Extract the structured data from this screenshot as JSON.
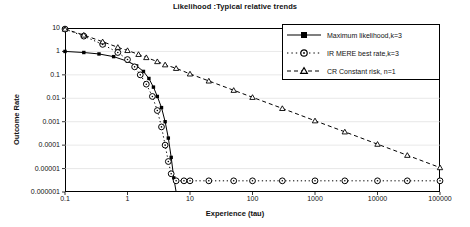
{
  "chart_data": {
    "type": "line",
    "title": "Likelihood :Typical relative trends",
    "xlabel": "Experience (tau)",
    "ylabel": "Outcome Rate",
    "xscale": "log",
    "yscale": "log",
    "xlim": [
      0.1,
      100000
    ],
    "ylim": [
      1e-06,
      10
    ],
    "xticks": [
      "0.1",
      "1",
      "10",
      "100",
      "1000",
      "10000",
      "100000"
    ],
    "yticks": [
      "10",
      "1",
      "0.1",
      "0.01",
      "0.001",
      "0.0001",
      "0.00001",
      "0.000001"
    ],
    "grid": "horizontal",
    "legend_position": "top-right",
    "series": [
      {
        "name": "Maximum likelihood,k=3",
        "marker": "filled-square",
        "linestyle": "solid",
        "color": "#000000",
        "x": [
          0.1,
          0.2,
          0.35,
          0.6,
          1.0,
          1.4,
          1.8,
          2.2,
          2.6,
          3.0,
          3.5,
          4.0,
          4.5,
          5.0,
          5.5,
          6.0
        ],
        "y": [
          1.0,
          0.9,
          0.78,
          0.6,
          0.38,
          0.24,
          0.14,
          0.07,
          0.03,
          0.012,
          0.004,
          0.001,
          0.0002,
          3e-05,
          4e-06,
          6e-07
        ]
      },
      {
        "name": "IR MERE best rate,k=3",
        "marker": "open-circle",
        "linestyle": "dotted",
        "color": "#000000",
        "x": [
          0.1,
          0.2,
          0.4,
          0.7,
          1.0,
          1.3,
          1.6,
          2.0,
          2.5,
          3.0,
          3.5,
          4.0,
          4.5,
          5.0,
          6.0,
          8.0,
          10,
          20,
          50,
          100,
          300,
          1000,
          3000,
          10000,
          30000,
          100000
        ],
        "y": [
          9.0,
          4.5,
          2.0,
          0.9,
          0.45,
          0.22,
          0.1,
          0.04,
          0.012,
          0.003,
          0.0006,
          0.0001,
          2e-05,
          6e-06,
          3e-06,
          3e-06,
          3e-06,
          3e-06,
          3e-06,
          3e-06,
          3e-06,
          3e-06,
          3e-06,
          3e-06,
          3e-06,
          3e-06
        ]
      },
      {
        "name": "CR Constant risk, n=1",
        "marker": "open-triangle",
        "linestyle": "dashed",
        "color": "#000000",
        "x": [
          0.1,
          0.2,
          0.4,
          0.7,
          1.0,
          1.5,
          2.0,
          3.0,
          4.0,
          6.0,
          10,
          20,
          50,
          100,
          300,
          1000,
          3000,
          10000,
          30000,
          100000
        ],
        "y": [
          9.0,
          5.0,
          2.6,
          1.5,
          1.1,
          0.75,
          0.55,
          0.37,
          0.27,
          0.19,
          0.11,
          0.055,
          0.022,
          0.011,
          0.0037,
          0.0011,
          0.00037,
          0.00011,
          3.7e-05,
          1.1e-05
        ]
      }
    ]
  },
  "legend": {
    "items": [
      {
        "label": "Maximum likelihood,k=3"
      },
      {
        "label": "IR MERE best rate,k=3"
      },
      {
        "label": "CR Constant risk, n=1"
      }
    ]
  }
}
